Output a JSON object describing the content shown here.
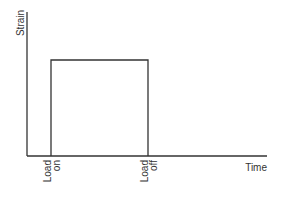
{
  "diagram": {
    "type": "strain-time step (creep load) diagram",
    "y_axis_label": "Strain",
    "x_axis_label": "Time",
    "markers": [
      {
        "line1": "Load",
        "line2": "on"
      },
      {
        "line1": "Load",
        "line2": "off"
      }
    ],
    "colors": {
      "axis": "#333333",
      "curve": "#333333",
      "text": "#333333",
      "background": "#ffffff"
    }
  }
}
